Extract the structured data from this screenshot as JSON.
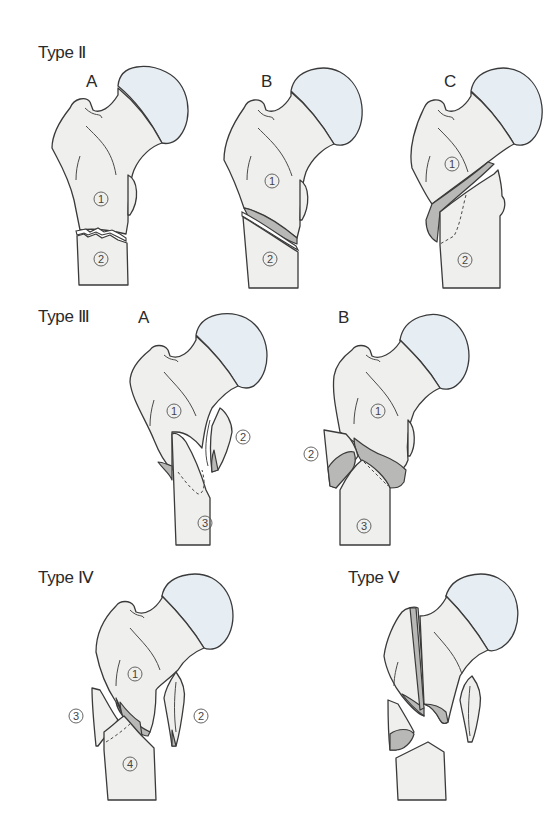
{
  "figure": {
    "colors": {
      "bone_fill": "#efefed",
      "femoral_head_fill": "#e6eef4",
      "fracture_surface_fill": "#b8b8b6",
      "outline": "#3a3a3a"
    }
  },
  "types": [
    {
      "title": "Type Ⅱ",
      "variants": [
        {
          "label": "A",
          "fragments": [
            "①",
            "②"
          ]
        },
        {
          "label": "B",
          "fragments": [
            "①",
            "②"
          ]
        },
        {
          "label": "C",
          "fragments": [
            "①",
            "②"
          ]
        }
      ]
    },
    {
      "title": "Type Ⅲ",
      "variants": [
        {
          "label": "A",
          "fragments": [
            "①",
            "②",
            "③"
          ]
        },
        {
          "label": "B",
          "fragments": [
            "①",
            "②",
            "③"
          ]
        }
      ]
    },
    {
      "title": "Type Ⅳ",
      "variants": [
        {
          "label": "",
          "fragments": [
            "①",
            "②",
            "③",
            "④"
          ]
        }
      ]
    },
    {
      "title": "Type Ⅴ",
      "variants": [
        {
          "label": "",
          "fragments": []
        }
      ]
    }
  ],
  "numbers": {
    "n1": "1",
    "n2": "2",
    "n3": "3",
    "n4": "4"
  }
}
